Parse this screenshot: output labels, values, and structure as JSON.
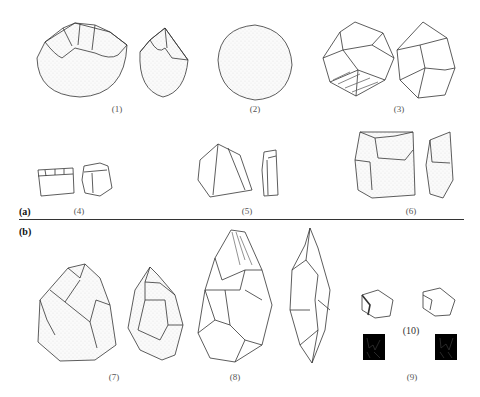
{
  "figure": {
    "panels": [
      {
        "id": "a",
        "label": "(a)"
      },
      {
        "id": "b",
        "label": "(b)"
      }
    ],
    "items": [
      {
        "n": 1,
        "label": "(1)",
        "panel": "a"
      },
      {
        "n": 2,
        "label": "(2)",
        "panel": "a"
      },
      {
        "n": 3,
        "label": "(3)",
        "panel": "a"
      },
      {
        "n": 4,
        "label": "(4)",
        "panel": "a"
      },
      {
        "n": 5,
        "label": "(5)",
        "panel": "a"
      },
      {
        "n": 6,
        "label": "(6)",
        "panel": "a"
      },
      {
        "n": 7,
        "label": "(7)",
        "panel": "b"
      },
      {
        "n": 8,
        "label": "(8)",
        "panel": "b"
      },
      {
        "n": 9,
        "label": "(9)",
        "panel": "b"
      },
      {
        "n": 10,
        "label": "(10)",
        "panel": "b"
      }
    ]
  }
}
